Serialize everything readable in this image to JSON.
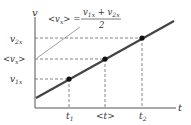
{
  "diagram": {
    "axes": {
      "y_label": "v",
      "x_label": "t"
    },
    "y_ticks": [
      {
        "id": "v2x",
        "main": "v",
        "sub": "2x",
        "y": 38
      },
      {
        "id": "avg_vx",
        "main": "<v",
        "sub": "x",
        "tail": ">",
        "y": 59
      },
      {
        "id": "v1x",
        "main": "v",
        "sub": "1x",
        "y": 79
      }
    ],
    "x_ticks": [
      {
        "id": "t1",
        "main": "t",
        "sub": "1",
        "x": 69
      },
      {
        "id": "avg_t",
        "main": "<t>",
        "sub": "",
        "x": 105
      },
      {
        "id": "t2",
        "main": "t",
        "sub": "2",
        "x": 142
      }
    ],
    "equation": {
      "lhs": "<v",
      "lhs_sub": "x",
      "lhs_tail": "> =",
      "numerator": "v",
      "num_sub1": "1x",
      "plus": " + v",
      "num_sub2": "2x",
      "denominator": "2"
    },
    "line": {
      "x1": 36,
      "y1": 98,
      "x2": 174,
      "y2": 21,
      "color": "#444444"
    },
    "points": [
      {
        "x": 69,
        "y": 79
      },
      {
        "x": 105,
        "y": 59
      },
      {
        "x": 142,
        "y": 38
      }
    ]
  }
}
